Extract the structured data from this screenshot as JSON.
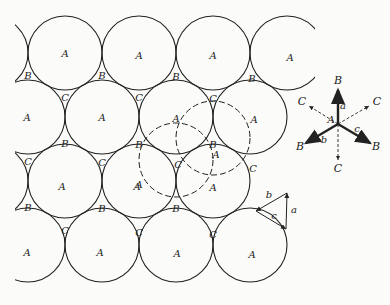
{
  "figure": {
    "colors": {
      "ink": "#222222",
      "paper": "#fbfbf9"
    },
    "radius": 37,
    "circles_A": [
      {
        "cx": -9,
        "cy": 53,
        "label": ""
      },
      {
        "cx": 65,
        "cy": 53,
        "label": "A"
      },
      {
        "cx": 139,
        "cy": 53,
        "label": "A"
      },
      {
        "cx": 213,
        "cy": 53,
        "label": "A"
      },
      {
        "cx": 287,
        "cy": 53,
        "label": "A"
      },
      {
        "cx": 28,
        "cy": 117,
        "label": "A"
      },
      {
        "cx": 102,
        "cy": 117,
        "label": "A"
      },
      {
        "cx": 176,
        "cy": 117,
        "label": ""
      },
      {
        "cx": 250,
        "cy": 117,
        "label": "A"
      },
      {
        "cx": -9,
        "cy": 181,
        "label": ""
      },
      {
        "cx": 65,
        "cy": 181,
        "label": "A"
      },
      {
        "cx": 139,
        "cy": 181,
        "label": "A"
      },
      {
        "cx": 213,
        "cy": 181,
        "label": "A"
      },
      {
        "cx": 28,
        "cy": 245,
        "label": "A"
      },
      {
        "cx": 102,
        "cy": 245,
        "label": "A"
      },
      {
        "cx": 176,
        "cy": 245,
        "label": "A"
      },
      {
        "cx": 250,
        "cy": 245,
        "label": "A"
      }
    ],
    "dashed_circles": [
      {
        "cx": 176,
        "cy": 160,
        "label": "A"
      },
      {
        "cx": 213,
        "cy": 138,
        "label": "A"
      }
    ],
    "labels_A": [
      {
        "x": 65,
        "y": 57,
        "text": "A"
      },
      {
        "x": 139,
        "y": 59,
        "text": "A"
      },
      {
        "x": 213,
        "y": 59,
        "text": "A"
      },
      {
        "x": 290,
        "y": 61,
        "text": "A"
      },
      {
        "x": 27,
        "y": 121,
        "text": "A"
      },
      {
        "x": 102,
        "y": 121,
        "text": "A"
      },
      {
        "x": 176,
        "y": 122,
        "text": "A"
      },
      {
        "x": 254,
        "y": 123,
        "text": "A"
      },
      {
        "x": 62,
        "y": 190,
        "text": "A"
      },
      {
        "x": 137,
        "y": 190,
        "text": "A"
      },
      {
        "x": 213,
        "y": 191,
        "text": "A"
      },
      {
        "x": 137,
        "y": 191,
        "text": ""
      },
      {
        "x": 27,
        "y": 256,
        "text": "A"
      },
      {
        "x": 100,
        "y": 256,
        "text": "A"
      },
      {
        "x": 177,
        "y": 257,
        "text": "A"
      },
      {
        "x": 252,
        "y": 258,
        "text": "A"
      },
      {
        "x": 139,
        "y": 188,
        "text": "A"
      },
      {
        "x": 216,
        "y": 158,
        "text": "A"
      }
    ],
    "labels_B": [
      {
        "x": 28,
        "y": 79,
        "text": "B"
      },
      {
        "x": 102,
        "y": 79,
        "text": "B"
      },
      {
        "x": 176,
        "y": 80,
        "text": "B"
      },
      {
        "x": 252,
        "y": 82,
        "text": "B"
      },
      {
        "x": 65,
        "y": 147,
        "text": "B"
      },
      {
        "x": 139,
        "y": 148,
        "text": "B"
      },
      {
        "x": 213,
        "y": 148,
        "text": "B"
      },
      {
        "x": 28,
        "y": 211,
        "text": "B"
      },
      {
        "x": 102,
        "y": 212,
        "text": "B"
      },
      {
        "x": 176,
        "y": 212,
        "text": "B"
      }
    ],
    "labels_C": [
      {
        "x": 65,
        "y": 101,
        "text": "C"
      },
      {
        "x": 139,
        "y": 101,
        "text": "C"
      },
      {
        "x": 213,
        "y": 102,
        "text": "C"
      },
      {
        "x": 28,
        "y": 165,
        "text": "C"
      },
      {
        "x": 102,
        "y": 166,
        "text": "C"
      },
      {
        "x": 178,
        "y": 168,
        "text": "C"
      },
      {
        "x": 253,
        "y": 172,
        "text": "C"
      },
      {
        "x": 65,
        "y": 234,
        "text": "C"
      },
      {
        "x": 139,
        "y": 236,
        "text": "C"
      },
      {
        "x": 213,
        "y": 238,
        "text": "C"
      }
    ],
    "vector_diagram": {
      "origin": {
        "x": 338,
        "y": 124
      },
      "origin_label": "A",
      "solid_arrows": [
        {
          "to": "B",
          "x": 338,
          "y": 90,
          "label": "a",
          "label_x": 343,
          "label_y": 109
        },
        {
          "to": "B",
          "x": 306,
          "y": 143,
          "label": "b",
          "label_x": 324,
          "label_y": 143
        },
        {
          "to": "B",
          "x": 370,
          "y": 143,
          "label": "c",
          "label_x": 357,
          "label_y": 132
        }
      ],
      "dashed_arrows": [
        {
          "to": "C",
          "x": 309,
          "y": 106
        },
        {
          "to": "C",
          "x": 369,
          "y": 106
        },
        {
          "to": "C",
          "x": 338,
          "y": 160
        }
      ],
      "end_labels": [
        {
          "x": 338,
          "y": 84,
          "text": "B"
        },
        {
          "x": 300,
          "y": 150,
          "text": "B"
        },
        {
          "x": 376,
          "y": 150,
          "text": "B"
        },
        {
          "x": 302,
          "y": 105,
          "text": "C"
        },
        {
          "x": 377,
          "y": 105,
          "text": "C"
        },
        {
          "x": 338,
          "y": 172,
          "text": "C"
        }
      ]
    },
    "triangle": {
      "points": [
        [
          287,
          193
        ],
        [
          256,
          211
        ],
        [
          286,
          229
        ]
      ],
      "labels": [
        {
          "x": 269,
          "y": 198,
          "text": "b"
        },
        {
          "x": 294,
          "y": 213,
          "text": "a"
        },
        {
          "x": 274,
          "y": 219,
          "text": "c"
        }
      ]
    }
  }
}
